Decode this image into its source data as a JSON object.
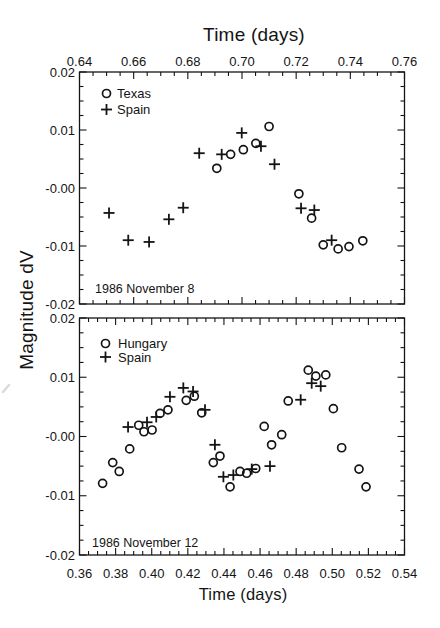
{
  "figure": {
    "top_axis_title": "Time (days)",
    "bottom_axis_title": "Time (days)",
    "y_axis_title": "Magnitude dV",
    "ink_color": "#141414",
    "background_color": "#ffffff"
  },
  "chart_data": [
    {
      "type": "scatter",
      "panel": "top",
      "xlabel": "Time (days)",
      "xlabel_position": "top",
      "ylabel": "Magnitude dV",
      "annotation": "1986 November 8",
      "xlim": [
        0.64,
        0.76
      ],
      "ylim": [
        -0.02,
        0.02
      ],
      "x_major_step": 0.02,
      "x_minor_step": 0.005,
      "y_major_step": 0.01,
      "y_minor_step": 0.0025,
      "grid": false,
      "legend_position": "upper-left",
      "x_tick_labels": [
        "0.64",
        "0.66",
        "0.68",
        "0.70",
        "0.72",
        "0.74",
        "0.76"
      ],
      "y_tick_labels": [
        "0.02",
        "0.01",
        "-0.00",
        "-0.01",
        "-0.02"
      ],
      "series": [
        {
          "name": "Texas",
          "marker": "circle",
          "points": [
            [
              0.6907,
              0.0034
            ],
            [
              0.6958,
              0.0058
            ],
            [
              0.7005,
              0.0066
            ],
            [
              0.7051,
              0.0077
            ],
            [
              0.71,
              0.0106
            ],
            [
              0.721,
              -0.001
            ],
            [
              0.7257,
              -0.0052
            ],
            [
              0.73,
              -0.0098
            ],
            [
              0.7355,
              -0.0105
            ],
            [
              0.7395,
              -0.0101
            ],
            [
              0.7446,
              -0.0091
            ]
          ]
        },
        {
          "name": "Spain",
          "marker": "plus",
          "points": [
            [
              0.6509,
              -0.0043
            ],
            [
              0.658,
              -0.009
            ],
            [
              0.6657,
              -0.0093
            ],
            [
              0.673,
              -0.0054
            ],
            [
              0.6783,
              -0.0034
            ],
            [
              0.6842,
              0.006
            ],
            [
              0.6925,
              0.0058
            ],
            [
              0.6999,
              0.0095
            ],
            [
              0.707,
              0.0072
            ],
            [
              0.712,
              0.0041
            ],
            [
              0.7218,
              -0.0035
            ],
            [
              0.7267,
              -0.0038
            ],
            [
              0.7331,
              -0.009
            ]
          ]
        }
      ]
    },
    {
      "type": "scatter",
      "panel": "bottom",
      "xlabel": "Time (days)",
      "xlabel_position": "bottom",
      "ylabel": "Magnitude dV",
      "annotation": "1986 November 12",
      "xlim": [
        0.36,
        0.54
      ],
      "ylim": [
        -0.02,
        0.02
      ],
      "x_major_step": 0.02,
      "x_minor_step": 0.005,
      "y_major_step": 0.01,
      "y_minor_step": 0.0025,
      "grid": false,
      "legend_position": "upper-left",
      "x_tick_labels": [
        "0.36",
        "0.38",
        "0.40",
        "0.42",
        "0.44",
        "0.46",
        "0.48",
        "0.50",
        "0.52",
        "0.54"
      ],
      "y_tick_labels": [
        "0.02",
        "0.01",
        "-0.00",
        "-0.01",
        "-0.02"
      ],
      "series": [
        {
          "name": "Hungary",
          "marker": "circle",
          "points": [
            [
              0.3728,
              -0.0079
            ],
            [
              0.3784,
              -0.0044
            ],
            [
              0.382,
              -0.0059
            ],
            [
              0.3878,
              -0.0021
            ],
            [
              0.3928,
              0.0019
            ],
            [
              0.3957,
              0.0008
            ],
            [
              0.4002,
              0.0011
            ],
            [
              0.4046,
              0.0039
            ],
            [
              0.409,
              0.0045
            ],
            [
              0.4191,
              0.0061
            ],
            [
              0.4236,
              0.0068
            ],
            [
              0.4277,
              0.004
            ],
            [
              0.4341,
              -0.0044
            ],
            [
              0.4378,
              -0.0033
            ],
            [
              0.4434,
              -0.0085
            ],
            [
              0.4489,
              -0.0059
            ],
            [
              0.4526,
              -0.0062
            ],
            [
              0.4576,
              -0.0054
            ],
            [
              0.4623,
              0.0017
            ],
            [
              0.4664,
              -0.0014
            ],
            [
              0.472,
              0.0003
            ],
            [
              0.4756,
              0.006
            ],
            [
              0.4867,
              0.0112
            ],
            [
              0.4909,
              0.0102
            ],
            [
              0.4964,
              0.0104
            ],
            [
              0.5006,
              0.0047
            ],
            [
              0.5052,
              -0.0019
            ],
            [
              0.5148,
              -0.0055
            ],
            [
              0.5187,
              -0.0085
            ]
          ]
        },
        {
          "name": "Spain",
          "marker": "plus",
          "points": [
            [
              0.3869,
              0.0016
            ],
            [
              0.3974,
              0.0024
            ],
            [
              0.4025,
              0.0033
            ],
            [
              0.4101,
              0.0067
            ],
            [
              0.4175,
              0.0082
            ],
            [
              0.4229,
              0.0076
            ],
            [
              0.4295,
              0.0045
            ],
            [
              0.435,
              -0.0014
            ],
            [
              0.4397,
              -0.0068
            ],
            [
              0.4452,
              -0.0065
            ],
            [
              0.4554,
              -0.0055
            ],
            [
              0.4655,
              -0.005
            ],
            [
              0.4825,
              0.0062
            ],
            [
              0.4886,
              0.009
            ],
            [
              0.4936,
              0.0085
            ]
          ]
        }
      ]
    }
  ]
}
